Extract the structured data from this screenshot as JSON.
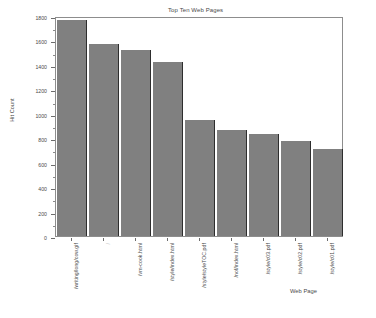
{
  "chart_data": {
    "type": "bar",
    "title": "Top Ten Web Pages",
    "xlabel": "Web Page",
    "ylabel": "Hit Count",
    "ylim": [
      0,
      1800
    ],
    "ytick_step": 200,
    "yminor_step": 100,
    "grid": false,
    "legend": false,
    "bar_color": "#808080",
    "bar_edge_color": "#2e2e2e",
    "frame_color": "#8d8d8d",
    "categories": [
      "/writing/long/cow.gif",
      "/",
      "/vm-cook.html",
      "/style/index.html",
      "/style/styleTOC.pdf",
      "/nof/index.html",
      "/style/c03.pdf",
      "/style/c02.pdf",
      "/style/c01.pdf"
    ],
    "values": [
      1770,
      1575,
      1520,
      1425,
      950,
      870,
      835,
      775,
      715
    ],
    "ytick_labels": [
      "0",
      "200",
      "400",
      "600",
      "800",
      "1000",
      "1200",
      "1400",
      "1600",
      "1800"
    ]
  }
}
